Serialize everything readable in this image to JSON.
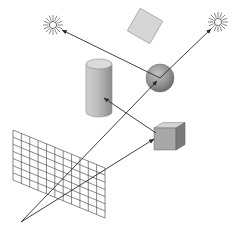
{
  "diagram": {
    "colors": {
      "line": "#2a2a2a",
      "grid": "#555555",
      "sun": "#555555",
      "object_light": "#e2e2e2",
      "object_mid": "#b8b8b8",
      "object_dark": "#7a7a7a",
      "background": "#ffffff"
    },
    "eye": {
      "x": 21,
      "y": 222
    },
    "image_plane": {
      "corners": [
        [
          13,
          130
        ],
        [
          105,
          168
        ],
        [
          105,
          218
        ],
        [
          13,
          180
        ]
      ],
      "columns": 11,
      "rows": 7
    },
    "lights": [
      {
        "name": "left-sun",
        "x": 53,
        "y": 25
      },
      {
        "name": "right-sun",
        "x": 218,
        "y": 22
      }
    ],
    "objects": {
      "cylinder": {
        "cx": 99,
        "top": 64,
        "bottom": 112,
        "rx": 13,
        "ry": 5
      },
      "tilted_square": {
        "cx": 145,
        "cy": 26,
        "size": 26,
        "angle": 30
      },
      "sphere": {
        "cx": 160,
        "cy": 78,
        "r": 14
      },
      "cube": {
        "x": 154,
        "y": 128,
        "size": 22,
        "depth": 9
      }
    },
    "rays": [
      {
        "name": "eye-to-sphere",
        "from": [
          21,
          222
        ],
        "to": [
          157,
          81
        ],
        "arrow": true
      },
      {
        "name": "sphere-to-right-sun",
        "from": [
          160,
          78
        ],
        "to": [
          211,
          29
        ],
        "arrow": true
      },
      {
        "name": "eye-to-cube",
        "from": [
          21,
          222
        ],
        "to": [
          154,
          139
        ],
        "arrow": true
      },
      {
        "name": "cube-to-cylinder",
        "from": [
          156,
          133
        ],
        "to": [
          104,
          98
        ],
        "arrow": true
      },
      {
        "name": "sphere-to-left-sun",
        "from": [
          160,
          78
        ],
        "to": [
          62,
          30
        ],
        "arrow": true
      }
    ],
    "caption": ""
  }
}
